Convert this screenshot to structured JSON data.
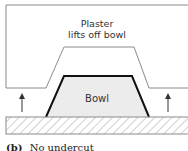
{
  "diagram": {
    "plaster_label_line1": "Plaster",
    "plaster_label_line2": "lifts off bowl",
    "bowl_label": "Bowl",
    "caption_tag": "(b)",
    "caption_text": "No undercut",
    "colors": {
      "plaster_outline": "#8a8a8a",
      "bowl_outline": "#111111",
      "bowl_fill": "#ececec",
      "base_hatch": "#8a8a8a",
      "arrow": "#333333"
    }
  }
}
